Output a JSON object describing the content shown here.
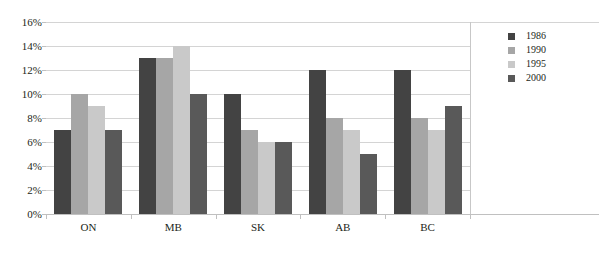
{
  "chart_data": {
    "type": "bar",
    "title": "",
    "subtitle": "",
    "xlabel": "",
    "ylabel": "",
    "categories": [
      "ON",
      "MB",
      "SK",
      "AB",
      "BC"
    ],
    "series": [
      {
        "name": "1986",
        "color": "#434343",
        "values": [
          7,
          13,
          10,
          12,
          12
        ]
      },
      {
        "name": "1990",
        "color": "#a6a6a6",
        "values": [
          10,
          13,
          7,
          8,
          8
        ]
      },
      {
        "name": "1995",
        "color": "#c9c9c9",
        "values": [
          9,
          14,
          6,
          7,
          7
        ]
      },
      {
        "name": "2000",
        "color": "#595959",
        "values": [
          7,
          10,
          6,
          5,
          9
        ]
      }
    ],
    "ylim": [
      0,
      16
    ],
    "y_ticks": [
      0,
      2,
      4,
      6,
      8,
      10,
      12,
      14,
      16
    ],
    "y_tick_labels": [
      "0%",
      "2%",
      "4%",
      "6%",
      "8%",
      "10%",
      "12%",
      "14%",
      "16%"
    ],
    "value_suffix": "%",
    "grid": true,
    "grid_axis": "y",
    "legend_position": "right",
    "legend_entries": [
      "1986",
      "1990",
      "1995",
      "2000"
    ],
    "annotations": []
  }
}
